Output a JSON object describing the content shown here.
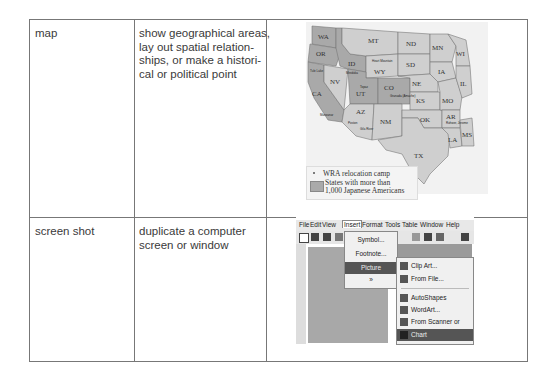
{
  "table": {
    "rows": [
      {
        "type": "map",
        "purpose": "show geographical areas, lay out spatial relationships, or make a historical or political point",
        "purpose_lines": [
          "show geographical areas,",
          "lay out spatial relation-",
          "ships, or make a histori-",
          "cal or political point"
        ]
      },
      {
        "type": "screen shot",
        "purpose": "duplicate a computer screen or window",
        "purpose_lines": [
          "duplicate a computer",
          "screen or window"
        ]
      }
    ]
  },
  "map": {
    "states": [
      "WA",
      "OR",
      "CA",
      "ID",
      "NV",
      "MT",
      "WY",
      "UT",
      "AZ",
      "CO",
      "NM",
      "ND",
      "SD",
      "NE",
      "KS",
      "OK",
      "TX",
      "MN",
      "IA",
      "MO",
      "AR",
      "LA",
      "WI",
      "IL",
      "MS"
    ],
    "camps": [
      "Tule Lake",
      "Minidoka",
      "Heart Mountain",
      "Manzanar",
      "Topaz",
      "Granada (Amache)",
      "Poston",
      "Gila River",
      "Rohwer",
      "Jerome"
    ],
    "legend": {
      "camp_label": "WRA relocation camp",
      "shaded_label_line1": "States with more than",
      "shaded_label_line2": "1,000 Japanese Americans"
    },
    "colors": {
      "shaded": "#a9a9a9",
      "unshaded": "#cfcfcf",
      "background": "#f2f2f2"
    }
  },
  "screenshot": {
    "menubar": [
      "File",
      "Edit",
      "View",
      "Insert",
      "Format",
      "Tools",
      "Table",
      "Window",
      "Help"
    ],
    "active_menu": "Insert",
    "insert_menu": [
      "Symbol...",
      "Footnote...",
      "Picture",
      "»"
    ],
    "highlighted_insert_item": "Picture",
    "picture_submenu": [
      "Clip Art...",
      "From File...",
      "AutoShapes",
      "WordArt...",
      "From Scanner or Camera...",
      "Chart"
    ],
    "highlighted_submenu_item": "Chart"
  }
}
